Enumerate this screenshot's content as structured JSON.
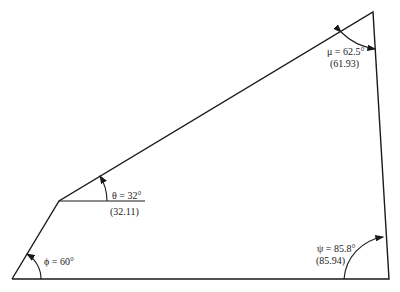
{
  "diagram": {
    "type": "quadrilateral angle diagram",
    "stroke_color": "#1a1a1a",
    "vertices": {
      "bottom_left": [
        12,
        279
      ],
      "bottom_right": [
        389,
        279
      ],
      "top_right": [
        373,
        12
      ],
      "left_mid": [
        59,
        201
      ]
    },
    "angles": [
      {
        "id": "phi",
        "label": "ϕ = 60°",
        "computed": ""
      },
      {
        "id": "theta",
        "label": "θ = 32°",
        "computed": "(32.11)"
      },
      {
        "id": "mu",
        "label": "μ = 62.5°",
        "computed": "(61.93)"
      },
      {
        "id": "psi",
        "label": "ψ = 85.8°",
        "computed": "(85.94)"
      }
    ]
  }
}
